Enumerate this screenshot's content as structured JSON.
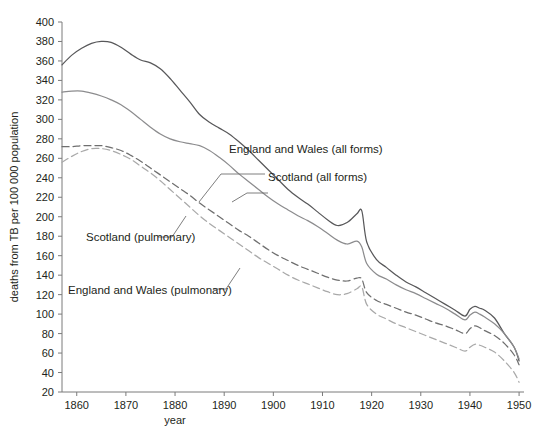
{
  "chart_data": {
    "type": "line",
    "title": "",
    "xlabel": "year",
    "ylabel": "deaths from TB per 100 000 population",
    "xlim": [
      1857,
      1951
    ],
    "ylim": [
      20,
      400
    ],
    "xticks": [
      1860,
      1870,
      1880,
      1890,
      1900,
      1910,
      1920,
      1930,
      1940,
      1950
    ],
    "yticks": [
      20,
      40,
      60,
      80,
      100,
      120,
      140,
      160,
      180,
      200,
      220,
      240,
      260,
      280,
      300,
      320,
      340,
      360,
      380,
      400
    ],
    "grid": false,
    "legend_position": "inline-annotations",
    "series": [
      {
        "name": "England and Wales (all forms)",
        "style": "solid",
        "color": "#58585a",
        "x": [
          1857,
          1859,
          1861,
          1863,
          1865,
          1867,
          1869,
          1871,
          1873,
          1875,
          1877,
          1879,
          1881,
          1883,
          1885,
          1887,
          1889,
          1891,
          1893,
          1895,
          1897,
          1899,
          1901,
          1903,
          1905,
          1907,
          1909,
          1911,
          1913,
          1915,
          1917,
          1918,
          1919,
          1921,
          1923,
          1925,
          1927,
          1929,
          1931,
          1933,
          1935,
          1937,
          1939,
          1940,
          1941,
          1942,
          1943,
          1945,
          1947,
          1949,
          1950
        ],
        "y": [
          356,
          366,
          373,
          378,
          380,
          379,
          374,
          367,
          361,
          358,
          352,
          342,
          330,
          318,
          305,
          297,
          291,
          285,
          277,
          268,
          258,
          248,
          238,
          228,
          220,
          213,
          205,
          197,
          191,
          194,
          203,
          206,
          174,
          156,
          148,
          140,
          133,
          128,
          122,
          116,
          110,
          104,
          98,
          105,
          108,
          106,
          104,
          96,
          80,
          66,
          52
        ]
      },
      {
        "name": "Scotland (all forms)",
        "style": "solid",
        "color": "#8c8c8e",
        "x": [
          1857,
          1859,
          1861,
          1863,
          1865,
          1867,
          1869,
          1871,
          1873,
          1875,
          1877,
          1879,
          1881,
          1883,
          1885,
          1887,
          1889,
          1891,
          1893,
          1895,
          1897,
          1899,
          1901,
          1903,
          1905,
          1907,
          1909,
          1911,
          1913,
          1915,
          1917,
          1918,
          1919,
          1921,
          1923,
          1925,
          1927,
          1929,
          1931,
          1933,
          1935,
          1937,
          1939,
          1940,
          1941,
          1942,
          1943,
          1945,
          1947,
          1949,
          1950
        ],
        "y": [
          328,
          329,
          329,
          327,
          324,
          320,
          315,
          308,
          300,
          292,
          285,
          280,
          277,
          275,
          273,
          268,
          261,
          253,
          244,
          236,
          228,
          220,
          213,
          207,
          201,
          196,
          190,
          183,
          176,
          172,
          175,
          169,
          152,
          141,
          136,
          130,
          125,
          121,
          116,
          111,
          106,
          100,
          94,
          99,
          102,
          100,
          97,
          90,
          80,
          66,
          54
        ]
      },
      {
        "name": "Scotland (pulmonary)",
        "style": "dashed",
        "color": "#6f6f6f",
        "x": [
          1857,
          1859,
          1861,
          1863,
          1865,
          1867,
          1869,
          1871,
          1873,
          1875,
          1877,
          1879,
          1881,
          1883,
          1885,
          1887,
          1889,
          1891,
          1893,
          1895,
          1897,
          1899,
          1901,
          1903,
          1905,
          1907,
          1909,
          1911,
          1913,
          1915,
          1917,
          1918,
          1919,
          1921,
          1923,
          1925,
          1927,
          1929,
          1931,
          1933,
          1935,
          1937,
          1939,
          1940,
          1941,
          1942,
          1943,
          1945,
          1947,
          1949,
          1950
        ],
        "y": [
          272,
          272,
          273,
          273,
          273,
          271,
          268,
          263,
          257,
          250,
          243,
          236,
          229,
          222,
          214,
          207,
          200,
          193,
          186,
          180,
          173,
          166,
          160,
          155,
          150,
          146,
          142,
          138,
          135,
          134,
          137,
          136,
          122,
          114,
          110,
          106,
          102,
          99,
          95,
          91,
          88,
          84,
          80,
          85,
          88,
          86,
          83,
          78,
          70,
          58,
          48
        ]
      },
      {
        "name": "England and Wales (pulmonary)",
        "style": "dashed",
        "color": "#a9a9a9",
        "x": [
          1857,
          1859,
          1861,
          1863,
          1865,
          1867,
          1869,
          1871,
          1873,
          1875,
          1877,
          1879,
          1881,
          1883,
          1885,
          1887,
          1889,
          1891,
          1893,
          1895,
          1897,
          1899,
          1901,
          1903,
          1905,
          1907,
          1909,
          1911,
          1913,
          1915,
          1917,
          1918,
          1919,
          1921,
          1923,
          1925,
          1927,
          1929,
          1931,
          1933,
          1935,
          1937,
          1939,
          1940,
          1941,
          1942,
          1943,
          1945,
          1947,
          1949,
          1950
        ],
        "y": [
          256,
          262,
          267,
          270,
          270,
          268,
          264,
          259,
          252,
          245,
          237,
          228,
          219,
          210,
          201,
          193,
          186,
          179,
          172,
          165,
          158,
          152,
          146,
          140,
          135,
          131,
          127,
          123,
          120,
          121,
          126,
          128,
          110,
          100,
          95,
          90,
          86,
          82,
          78,
          74,
          70,
          66,
          62,
          66,
          69,
          68,
          66,
          61,
          52,
          40,
          30
        ]
      }
    ],
    "annotations": [
      {
        "text": "England and Wales (all forms)",
        "target_series": "England and Wales (all forms)"
      },
      {
        "text": "Scotland (all forms)",
        "target_series": "Scotland (all forms)"
      },
      {
        "text": "Scotland (pulmonary)",
        "target_series": "Scotland (pulmonary)"
      },
      {
        "text": "England and Wales (pulmonary)",
        "target_series": "England and Wales (pulmonary)"
      }
    ]
  },
  "axes": {
    "x_title": "year",
    "y_title": "deaths from TB per 100 000 population",
    "x_tick_labels": [
      "1860",
      "1870",
      "1880",
      "1890",
      "1900",
      "1910",
      "1920",
      "1930",
      "1940",
      "1950"
    ],
    "y_tick_labels": [
      "400",
      "380",
      "360",
      "340",
      "320",
      "300",
      "280",
      "260",
      "240",
      "220",
      "200",
      "180",
      "160",
      "140",
      "120",
      "100",
      "80",
      "60",
      "40",
      "20"
    ]
  },
  "labels": {
    "ew_all": "England and Wales (all forms)",
    "scot_all": "Scotland (all forms)",
    "scot_pulm": "Scotland (pulmonary)",
    "ew_pulm": "England and Wales (pulmonary)"
  },
  "colors": {
    "ew_all": "#58585a",
    "scot_all": "#8c8c8e",
    "scot_pulm": "#6f6f6f",
    "ew_pulm": "#a9a9a9",
    "axis": "#7b7b7b",
    "text": "#231f20",
    "background": "#ffffff"
  }
}
